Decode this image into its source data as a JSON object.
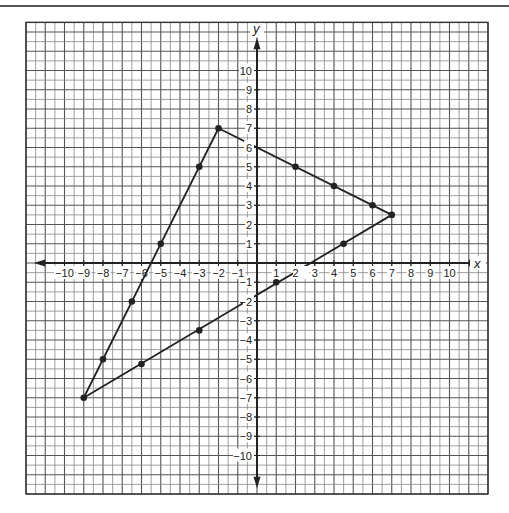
{
  "chart_data": {
    "type": "line",
    "title": "",
    "xlabel": "x",
    "ylabel": "y",
    "xlim": [
      -12,
      12
    ],
    "ylim": [
      -12,
      12.5
    ],
    "grid": true,
    "grid_step": 0.5,
    "x_ticks": [
      -10,
      -9,
      -8,
      -7,
      -6,
      -5,
      -4,
      -3,
      -2,
      -1,
      1,
      2,
      3,
      4,
      5,
      6,
      7,
      8,
      9,
      10
    ],
    "y_ticks": [
      -10,
      -9,
      -8,
      -7,
      -6,
      -5,
      -4,
      -3,
      -2,
      -1,
      1,
      2,
      3,
      4,
      5,
      6,
      7,
      8,
      9,
      10
    ],
    "x_tick_labels": [
      "−10",
      "−9",
      "−8",
      "−7",
      "−6",
      "−5",
      "−4",
      "−3",
      "−2",
      "−1",
      "1",
      "2",
      "3",
      "4",
      "5",
      "6",
      "7",
      "8",
      "9",
      "10"
    ],
    "y_tick_labels": [
      "−10",
      "−9",
      "−8",
      "−7",
      "−6",
      "−5",
      "−4",
      "−3",
      "−2",
      "−1",
      "1",
      "2",
      "3",
      "4",
      "5",
      "6",
      "7",
      "8",
      "9",
      "10"
    ],
    "series": [
      {
        "name": "triangle",
        "vertices": [
          [
            -2,
            7
          ],
          [
            7,
            2.5
          ],
          [
            -9,
            -7
          ]
        ],
        "closed": true
      }
    ],
    "points": [
      [
        -2,
        7
      ],
      [
        7,
        2.5
      ],
      [
        -9,
        -7
      ],
      [
        2,
        5
      ],
      [
        4,
        4
      ],
      [
        6,
        3
      ],
      [
        -3,
        5
      ],
      [
        -5,
        1
      ],
      [
        -6.5,
        -2
      ],
      [
        -8,
        -5
      ],
      [
        -6,
        -5.25
      ],
      [
        -3,
        -3.5
      ],
      [
        1,
        -1
      ],
      [
        4.5,
        1
      ]
    ]
  },
  "labels": {
    "x_axis": "x",
    "y_axis": "y"
  }
}
